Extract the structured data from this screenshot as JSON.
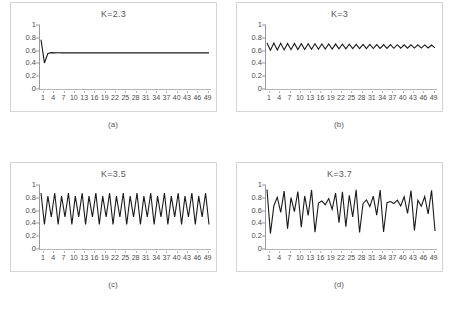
{
  "figure": {
    "layout": "2x2",
    "line_color": "#1a1a1a",
    "frame_color": "#d4d4d4",
    "axis_color": "#9a9a9a"
  },
  "panels": [
    {
      "title": "K=2.3",
      "caption": "(a)"
    },
    {
      "title": "K=3",
      "caption": "(b)"
    },
    {
      "title": "K=3.5",
      "caption": "(c)"
    },
    {
      "title": "K=3.7",
      "caption": "(d)"
    }
  ],
  "chart_data": [
    {
      "type": "line",
      "title": "K=2.3",
      "caption": "(a)",
      "xlabel": "",
      "ylabel": "",
      "xlim": [
        1,
        50
      ],
      "ylim": [
        0,
        1
      ],
      "grid": false,
      "legend": null,
      "ytick_labels": [
        "1",
        "0.8",
        "0.6",
        "0.4",
        "0.2",
        "0"
      ],
      "ytick_values": [
        1,
        0.8,
        0.6,
        0.4,
        0.2,
        0
      ],
      "xtick_labels": [
        "1",
        "4",
        "7",
        "10",
        "13",
        "16",
        "19",
        "22",
        "25",
        "28",
        "31",
        "34",
        "37",
        "40",
        "43",
        "46",
        "49"
      ],
      "xtick_values": [
        1,
        4,
        7,
        10,
        13,
        16,
        19,
        22,
        25,
        28,
        31,
        34,
        37,
        40,
        43,
        46,
        49
      ],
      "x": [
        1,
        2,
        3,
        4,
        5,
        6,
        7,
        8,
        9,
        10,
        11,
        12,
        13,
        14,
        15,
        16,
        17,
        18,
        19,
        20,
        21,
        22,
        23,
        24,
        25,
        26,
        27,
        28,
        29,
        30,
        31,
        32,
        33,
        34,
        35,
        36,
        37,
        38,
        39,
        40,
        41,
        42,
        43,
        44,
        45,
        46,
        47,
        48,
        49,
        50
      ],
      "values": [
        0.77,
        0.407,
        0.555,
        0.568,
        0.565,
        0.5653,
        0.5652,
        0.5652,
        0.5652,
        0.5652,
        0.5652,
        0.5652,
        0.5652,
        0.5652,
        0.5652,
        0.5652,
        0.5652,
        0.5652,
        0.5652,
        0.5652,
        0.5652,
        0.5652,
        0.5652,
        0.5652,
        0.5652,
        0.5652,
        0.5652,
        0.5652,
        0.5652,
        0.5652,
        0.5652,
        0.5652,
        0.5652,
        0.5652,
        0.5652,
        0.5652,
        0.5652,
        0.5652,
        0.5652,
        0.5652,
        0.5652,
        0.5652,
        0.5652,
        0.5652,
        0.5652,
        0.5652,
        0.5652,
        0.5652,
        0.5652,
        0.5652
      ]
    },
    {
      "type": "line",
      "title": "K=3",
      "caption": "(b)",
      "xlabel": "",
      "ylabel": "",
      "xlim": [
        1,
        50
      ],
      "ylim": [
        0,
        1
      ],
      "grid": false,
      "legend": null,
      "ytick_labels": [
        "1",
        "0.8",
        "0.6",
        "0.4",
        "0.2",
        "0"
      ],
      "ytick_values": [
        1,
        0.8,
        0.6,
        0.4,
        0.2,
        0
      ],
      "xtick_labels": [
        "1",
        "4",
        "7",
        "10",
        "13",
        "16",
        "19",
        "22",
        "25",
        "28",
        "31",
        "34",
        "37",
        "40",
        "43",
        "46",
        "49"
      ],
      "xtick_values": [
        1,
        4,
        7,
        10,
        13,
        16,
        19,
        22,
        25,
        28,
        31,
        34,
        37,
        40,
        43,
        46,
        49
      ],
      "x": [
        1,
        2,
        3,
        4,
        5,
        6,
        7,
        8,
        9,
        10,
        11,
        12,
        13,
        14,
        15,
        16,
        17,
        18,
        19,
        20,
        21,
        22,
        23,
        24,
        25,
        26,
        27,
        28,
        29,
        30,
        31,
        32,
        33,
        34,
        35,
        36,
        37,
        38,
        39,
        40,
        41,
        42,
        43,
        44,
        45,
        46,
        47,
        48,
        49,
        50
      ],
      "values": [
        0.72,
        0.605,
        0.717,
        0.609,
        0.715,
        0.611,
        0.713,
        0.614,
        0.711,
        0.616,
        0.709,
        0.618,
        0.707,
        0.62,
        0.706,
        0.622,
        0.704,
        0.624,
        0.703,
        0.625,
        0.702,
        0.627,
        0.7,
        0.628,
        0.699,
        0.63,
        0.698,
        0.631,
        0.697,
        0.632,
        0.696,
        0.633,
        0.695,
        0.634,
        0.694,
        0.635,
        0.693,
        0.636,
        0.692,
        0.637,
        0.691,
        0.638,
        0.69,
        0.639,
        0.69,
        0.64,
        0.689,
        0.641,
        0.688,
        0.642
      ]
    },
    {
      "type": "line",
      "title": "K=3.5",
      "caption": "(c)",
      "xlabel": "",
      "ylabel": "",
      "xlim": [
        1,
        50
      ],
      "ylim": [
        0,
        1
      ],
      "grid": false,
      "legend": null,
      "ytick_labels": [
        "1",
        "0.8",
        "0.6",
        "0.4",
        "0.2",
        "0"
      ],
      "ytick_values": [
        1,
        0.8,
        0.6,
        0.4,
        0.2,
        0
      ],
      "xtick_labels": [
        "1",
        "4",
        "7",
        "10",
        "13",
        "16",
        "19",
        "22",
        "25",
        "28",
        "31",
        "34",
        "37",
        "40",
        "43",
        "46",
        "49"
      ],
      "xtick_values": [
        1,
        4,
        7,
        10,
        13,
        16,
        19,
        22,
        25,
        28,
        31,
        34,
        37,
        40,
        43,
        46,
        49
      ],
      "x": [
        1,
        2,
        3,
        4,
        5,
        6,
        7,
        8,
        9,
        10,
        11,
        12,
        13,
        14,
        15,
        16,
        17,
        18,
        19,
        20,
        21,
        22,
        23,
        24,
        25,
        26,
        27,
        28,
        29,
        30,
        31,
        32,
        33,
        34,
        35,
        36,
        37,
        38,
        39,
        40,
        41,
        42,
        43,
        44,
        45,
        46,
        47,
        48,
        49,
        50
      ],
      "values": [
        0.875,
        0.383,
        0.827,
        0.5,
        0.875,
        0.383,
        0.827,
        0.5,
        0.875,
        0.383,
        0.827,
        0.5,
        0.875,
        0.383,
        0.827,
        0.5,
        0.875,
        0.383,
        0.827,
        0.5,
        0.875,
        0.383,
        0.827,
        0.5,
        0.875,
        0.383,
        0.827,
        0.5,
        0.875,
        0.383,
        0.827,
        0.5,
        0.875,
        0.383,
        0.827,
        0.5,
        0.875,
        0.383,
        0.827,
        0.5,
        0.875,
        0.383,
        0.827,
        0.5,
        0.875,
        0.383,
        0.827,
        0.5,
        0.875,
        0.383
      ]
    },
    {
      "type": "line",
      "title": "K=3.7",
      "caption": "(d)",
      "xlabel": "",
      "ylabel": "",
      "xlim": [
        1,
        50
      ],
      "ylim": [
        0,
        1
      ],
      "grid": false,
      "legend": null,
      "ytick_labels": [
        "1",
        "0.8",
        "0.6",
        "0.4",
        "0.2",
        "0"
      ],
      "ytick_values": [
        1,
        0.8,
        0.6,
        0.4,
        0.2,
        0
      ],
      "xtick_labels": [
        "1",
        "4",
        "7",
        "10",
        "13",
        "16",
        "19",
        "22",
        "25",
        "28",
        "31",
        "34",
        "37",
        "40",
        "43",
        "46",
        "49"
      ],
      "xtick_values": [
        1,
        4,
        7,
        10,
        13,
        16,
        19,
        22,
        25,
        28,
        31,
        34,
        37,
        40,
        43,
        46,
        49
      ],
      "x": [
        1,
        2,
        3,
        4,
        5,
        6,
        7,
        8,
        9,
        10,
        11,
        12,
        13,
        14,
        15,
        16,
        17,
        18,
        19,
        20,
        21,
        22,
        23,
        24,
        25,
        26,
        27,
        28,
        29,
        30,
        31,
        32,
        33,
        34,
        35,
        36,
        37,
        38,
        39,
        40,
        41,
        42,
        43,
        44,
        45,
        46,
        47,
        48,
        49,
        50
      ],
      "values": [
        0.93,
        0.241,
        0.677,
        0.809,
        0.572,
        0.905,
        0.318,
        0.803,
        0.585,
        0.898,
        0.339,
        0.829,
        0.524,
        0.923,
        0.263,
        0.717,
        0.751,
        0.692,
        0.788,
        0.618,
        0.873,
        0.41,
        0.895,
        0.348,
        0.839,
        0.5,
        0.925,
        0.257,
        0.707,
        0.766,
        0.663,
        0.827,
        0.529,
        0.922,
        0.266,
        0.723,
        0.741,
        0.71,
        0.762,
        0.671,
        0.816,
        0.555,
        0.914,
        0.291,
        0.763,
        0.669,
        0.819,
        0.549,
        0.917,
        0.282
      ]
    }
  ]
}
